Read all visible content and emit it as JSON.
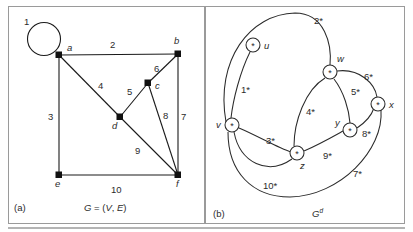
{
  "figure": {
    "panels": [
      {
        "key": "a",
        "tag": "(a)",
        "caption_plain": "G = (V, E)",
        "caption_g": "G",
        "caption_eq": " = (",
        "caption_v": "V",
        "caption_comma": ", ",
        "caption_e": "E",
        "caption_close": ")",
        "graph_type": "primal",
        "vertices": [
          {
            "id": "a",
            "label": "a",
            "x": 59,
            "y": 55,
            "lx": 67,
            "ly": 51
          },
          {
            "id": "b",
            "label": "b",
            "x": 178,
            "y": 54,
            "lx": 174,
            "ly": 44
          },
          {
            "id": "c",
            "label": "c",
            "x": 148,
            "y": 83,
            "lx": 155,
            "ly": 89
          },
          {
            "id": "d",
            "label": "d",
            "x": 120,
            "y": 117,
            "lx": 112,
            "ly": 129
          },
          {
            "id": "e",
            "label": "e",
            "x": 59,
            "y": 175,
            "lx": 55,
            "ly": 187
          },
          {
            "id": "f",
            "label": "f",
            "x": 178,
            "y": 175,
            "lx": 178,
            "ly": 187
          }
        ],
        "edges": [
          {
            "id": 1,
            "label": "1",
            "from": "a",
            "to": "a",
            "kind": "loop",
            "lx": 27,
            "ly": 22
          },
          {
            "id": 2,
            "label": "2",
            "from": "a",
            "to": "b",
            "kind": "straight",
            "lx": 113,
            "ly": 48
          },
          {
            "id": 3,
            "label": "3",
            "from": "a",
            "to": "e",
            "kind": "straight",
            "lx": 51,
            "ly": 117
          },
          {
            "id": 4,
            "label": "4",
            "from": "a",
            "to": "d",
            "kind": "straight",
            "lx": 101,
            "ly": 86
          },
          {
            "id": 5,
            "label": "5",
            "from": "d",
            "to": "c",
            "kind": "straight",
            "lx": 130,
            "ly": 92
          },
          {
            "id": 6,
            "label": "6",
            "from": "c",
            "to": "b",
            "kind": "straight",
            "lx": 157,
            "ly": 69
          },
          {
            "id": 7,
            "label": "7",
            "from": "b",
            "to": "f",
            "kind": "straight",
            "lx": 184,
            "ly": 117
          },
          {
            "id": 8,
            "label": "8",
            "from": "c",
            "to": "f",
            "kind": "straight",
            "lx": 167,
            "ly": 116
          },
          {
            "id": 9,
            "label": "9",
            "from": "d",
            "to": "f",
            "kind": "straight",
            "lx": 139,
            "ly": 151
          },
          {
            "id": 10,
            "label": "10",
            "from": "e",
            "to": "f",
            "kind": "straight",
            "lx": 117,
            "ly": 190
          }
        ],
        "loop": {
          "cx": 44,
          "cy": 39,
          "r": 16.5
        }
      },
      {
        "key": "b",
        "tag": "(b)",
        "caption_plain": "G^d",
        "caption_g": "G",
        "caption_sup": "d",
        "graph_type": "dual",
        "vertices": [
          {
            "id": "u",
            "label": "u",
            "x": 253,
            "y": 45,
            "r": 7,
            "lx": 265,
            "ly": 46
          },
          {
            "id": "v",
            "label": "v",
            "x": 232,
            "y": 125,
            "r": 7,
            "lx": 218,
            "ly": 128
          },
          {
            "id": "w",
            "label": "w",
            "x": 330,
            "y": 72,
            "r": 7,
            "lx": 339,
            "ly": 62
          },
          {
            "id": "x",
            "label": "x",
            "x": 378,
            "y": 104,
            "r": 7,
            "lx": 391,
            "ly": 108
          },
          {
            "id": "y",
            "label": "y",
            "x": 350,
            "y": 130,
            "r": 7,
            "lx": 338,
            "ly": 124
          },
          {
            "id": "z",
            "label": "z",
            "x": 297,
            "y": 153,
            "r": 7,
            "lx": 303,
            "ly": 167
          }
        ],
        "edges": [
          {
            "id": "1*",
            "label": "1*",
            "from": "u",
            "to": "v",
            "lx": 246,
            "ly": 90
          },
          {
            "id": "2*",
            "label": "2*",
            "from": "v",
            "to": "w",
            "lx": 320,
            "ly": 21
          },
          {
            "id": "3*",
            "label": "3*",
            "from": "v",
            "to": "z",
            "lx": 272,
            "ly": 141
          },
          {
            "id": "4*",
            "label": "4*",
            "from": "w",
            "to": "z",
            "lx": 312,
            "ly": 112
          },
          {
            "id": "5*",
            "label": "5*",
            "from": "w",
            "to": "y",
            "lx": 356,
            "ly": 92
          },
          {
            "id": "6*",
            "label": "6*",
            "from": "w",
            "to": "x",
            "lx": 370,
            "ly": 77
          },
          {
            "id": "7*",
            "label": "7*",
            "from": "x",
            "to": "v",
            "lx": 359,
            "ly": 174
          },
          {
            "id": "8*",
            "label": "8*",
            "from": "y",
            "to": "x",
            "lx": 368,
            "ly": 134
          },
          {
            "id": "9*",
            "label": "9*",
            "from": "z",
            "to": "y",
            "lx": 329,
            "ly": 156
          },
          {
            "id": "10*",
            "label": "10*",
            "from": "v",
            "to": "z",
            "lx": 273,
            "ly": 186
          }
        ],
        "node_glyph": "*"
      }
    ]
  }
}
